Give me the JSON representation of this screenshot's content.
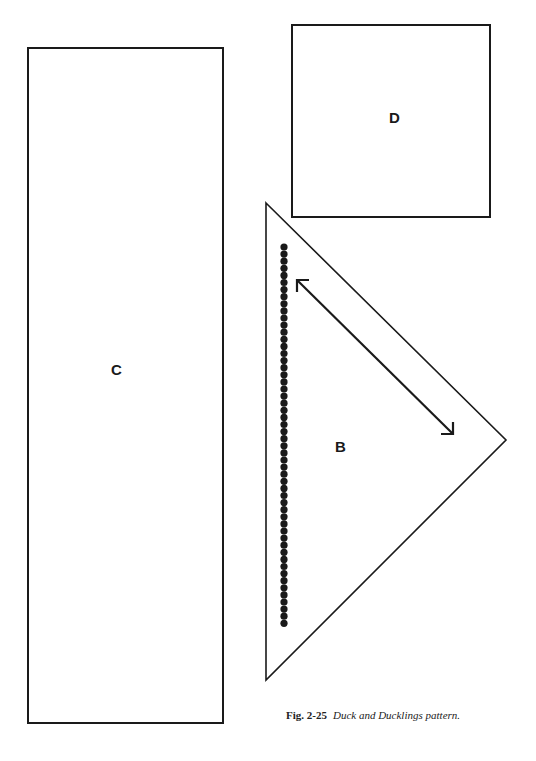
{
  "pieces": {
    "C": {
      "label": "C"
    },
    "D": {
      "label": "D"
    },
    "B": {
      "label": "B"
    }
  },
  "caption": {
    "figure": "Fig. 2-25",
    "title": "Duck and Ducklings pattern."
  },
  "colors": {
    "ink": "#1a1a1a",
    "paper": "#ffffff"
  }
}
